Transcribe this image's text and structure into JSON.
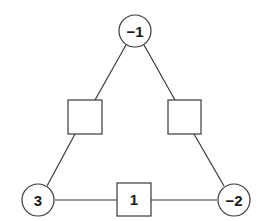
{
  "diagram": {
    "colors": {
      "stroke": "#3a3a3a",
      "text": "#1a1a1a",
      "background": "#ffffff"
    },
    "circles": [
      {
        "id": "top",
        "label": "−1",
        "cx": 135,
        "cy": 31
      },
      {
        "id": "bottom-left",
        "label": "3",
        "cx": 38,
        "cy": 200
      },
      {
        "id": "bottom-right",
        "label": "−2",
        "cx": 234,
        "cy": 200
      }
    ],
    "squares": [
      {
        "id": "left-edge",
        "label": "",
        "x": 68,
        "y": 100
      },
      {
        "id": "right-edge",
        "label": "",
        "x": 168,
        "y": 100
      },
      {
        "id": "bottom-edge",
        "label": "1",
        "x": 117,
        "y": 183
      }
    ]
  }
}
